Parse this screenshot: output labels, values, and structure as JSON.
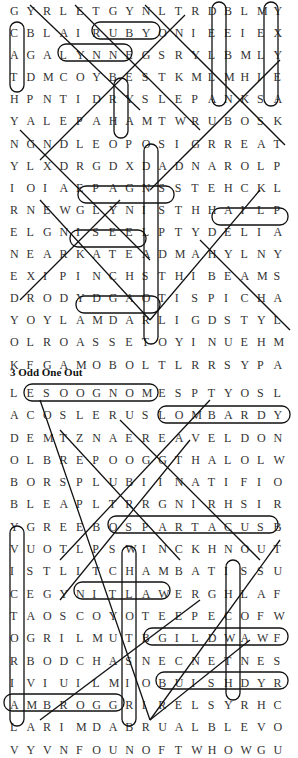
{
  "puzzle1": {
    "rows": [
      "GYRLETGYNLTRDBLMY",
      "CBLAIRUBYONIEEIEX",
      "AGALYNNEGSRYLBMLY",
      "TDMCOYBESTKMLMHIE",
      "HPNTIDRYSLEPANKSA",
      "YALEPAHAMTWRUBOSK",
      "NGNDLEOPOSIGRREAT",
      "YLXDRGDXDADNAROLP",
      "IOIAEPAGNSSTEHCKL",
      "RNEWGLYNISTHHAILP",
      "ELGNISEELPTYDELIA",
      "NEARKATEADMAHYLNY",
      "EXIPINCHSTHIBEAMS",
      "DRODYDGAOTISPICHA",
      "YOYLAMDARLIGDSTYL",
      "OLROASSETOYINUEHM",
      "KFGAMOBOLTLRRSYPA"
    ]
  },
  "puzzle2": {
    "heading": "3  Odd One Out",
    "rows": [
      "LESOOGNOMESPTYOSL",
      "ACOSLERUSLOMBARDY",
      "DEMTZNAEREAVELDON",
      "OLBREPOOGGTHALOLW",
      "BORSPLUBIINATIFIO",
      "BLEAPLTRRGNIRHSIR",
      "YGREEBOSPARTACUSB",
      "VUOTLPSWINCKHNOUT",
      "ISTLITCHAMBATISSU",
      "CEGYNITLAWERGHLAF",
      "TAOSCOYOTEEPECOFW",
      "OGRILMUTBGILDWAWF",
      "RBODCHASNECNETNES",
      "IVIUILMIOBUISHDYR",
      "AMBROGGRIRELSYRHC",
      "LARIMDABRUALBLEVO",
      "VYVNFOUNOFTWHOWGU"
    ]
  }
}
